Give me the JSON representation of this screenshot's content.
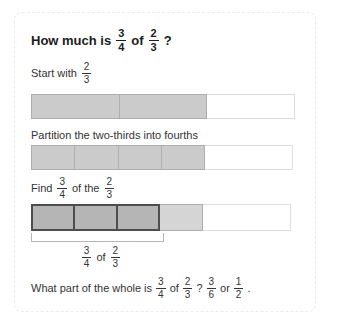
{
  "colors": {
    "card-border": "#ececec",
    "title-text": "#1c1c1c",
    "text": "#333333",
    "bar-fill": "#cbcbcb",
    "bar-border": "#aeaeae",
    "dark-fill": "#b5b5b5",
    "dark-border": "#4d4d4d",
    "light-fill": "#d5d5d5",
    "empty-fill": "#ffffff",
    "empty-border": "#dedede",
    "bracket": "#b5b5b5"
  },
  "title": {
    "prefix": "How much is",
    "frac_a": {
      "num": "3",
      "den": "4"
    },
    "of": "of",
    "frac_b": {
      "num": "2",
      "den": "3"
    },
    "suffix": "?"
  },
  "step1": {
    "prefix": "Start with",
    "frac": {
      "num": "2",
      "den": "3"
    }
  },
  "step2": {
    "label": "Partition the two-thirds into fourths"
  },
  "step3": {
    "prefix": "Find",
    "frac_a": {
      "num": "3",
      "den": "4"
    },
    "middle": "of the",
    "frac_b": {
      "num": "2",
      "den": "3"
    }
  },
  "bracket_label": {
    "frac_a": {
      "num": "3",
      "den": "4"
    },
    "of": "of",
    "frac_b": {
      "num": "2",
      "den": "3"
    }
  },
  "question": {
    "prefix": "What part of the whole is",
    "frac_a": {
      "num": "3",
      "den": "4"
    },
    "of": "of",
    "frac_b": {
      "num": "2",
      "den": "3"
    },
    "qmark": "?",
    "frac_c": {
      "num": "3",
      "den": "6"
    },
    "or": "or",
    "frac_d": {
      "num": "1",
      "den": "2"
    },
    "period": "."
  }
}
